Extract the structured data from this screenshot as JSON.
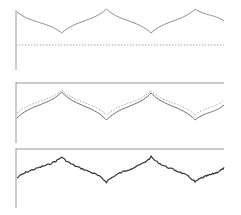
{
  "chart_data": [
    {
      "type": "line",
      "title": "",
      "xlabel": "",
      "ylabel": "",
      "grid": false,
      "legend": null,
      "series": [
        {
          "name": "signal (solid)",
          "style": "solid",
          "color": "#8a8a8a",
          "points": [
            [
              0,
              12
            ],
            [
              0.216,
              33
            ],
            [
              0.432,
              9
            ],
            [
              0.648,
              33
            ],
            [
              0.861,
              9
            ],
            [
              1.0,
              21
            ]
          ]
        },
        {
          "name": "baseline (dotted)",
          "style": "dotted",
          "color": "#9a9a9a",
          "points": [
            [
              0,
              45
            ],
            [
              1.0,
              45
            ]
          ]
        }
      ]
    },
    {
      "type": "line",
      "title": "",
      "xlabel": "",
      "ylabel": "",
      "grid": false,
      "legend": null,
      "series": [
        {
          "name": "signal (solid)",
          "style": "solid",
          "color": "#6a6a6a",
          "points": [
            [
              0,
              118
            ],
            [
              0.216,
              92
            ],
            [
              0.432,
              120
            ],
            [
              0.648,
              93
            ],
            [
              0.861,
              120
            ],
            [
              1.0,
              105
            ]
          ]
        },
        {
          "name": "reference (dotted)",
          "style": "dotted",
          "color": "#a0a0a0",
          "points": [
            [
              0,
              113
            ],
            [
              0.216,
              90
            ],
            [
              0.432,
              115
            ],
            [
              0.648,
              91
            ],
            [
              0.861,
              115
            ],
            [
              1.0,
              100
            ]
          ]
        }
      ]
    },
    {
      "type": "line",
      "title": "",
      "xlabel": "",
      "ylabel": "",
      "grid": false,
      "legend": null,
      "series": [
        {
          "name": "noisy signal",
          "style": "solid-noisy",
          "color": "#333333",
          "points": [
            [
              0,
              178
            ],
            [
              0.216,
              157
            ],
            [
              0.432,
              182
            ],
            [
              0.648,
              157
            ],
            [
              0.861,
              182
            ],
            [
              1.0,
              168
            ]
          ]
        }
      ]
    }
  ]
}
